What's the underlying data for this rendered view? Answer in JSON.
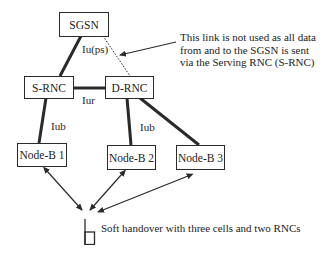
{
  "diagram": {
    "nodes": {
      "sgsn": "SGSN",
      "srnc": "S-RNC",
      "drnc": "D-RNC",
      "nodeb1": "Node-B 1",
      "nodeb2": "Node-B 2",
      "nodeb3": "Node-B 3"
    },
    "interfaces": {
      "iu_ps": "Iu(ps)",
      "iur": "Iur",
      "iub_left": "Iub",
      "iub_right": "Iub"
    },
    "annotation": {
      "lines": [
        "This link is not used as all data",
        "from and to the SGSN is sent",
        "via the Serving RNC (S-RNC)"
      ]
    },
    "caption": "Soft handover with three cells and two RNCs",
    "icons": {
      "mobile": "mobile-phone-icon"
    },
    "colors": {
      "line": "#2a2a2a",
      "text": "#222222",
      "background": "#ffffff"
    }
  }
}
